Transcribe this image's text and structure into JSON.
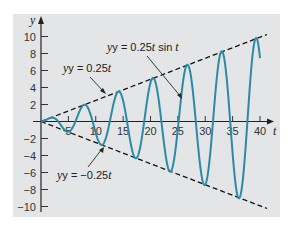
{
  "chart_data": {
    "type": "line",
    "title": "",
    "xlabel": "t",
    "ylabel": "y",
    "xlim": [
      0,
      41
    ],
    "ylim": [
      -11,
      11
    ],
    "x_ticks": [
      5,
      10,
      15,
      20,
      25,
      30,
      35,
      40
    ],
    "y_ticks": [
      -10,
      -8,
      -6,
      -4,
      -2,
      2,
      4,
      6,
      8,
      10
    ],
    "grid": false,
    "legend": "none (inline annotations)",
    "series": [
      {
        "name": "y = 0.25t sin t",
        "style": "solid",
        "color": "#2a8aa8",
        "function": "0.25*t*sin(t)",
        "t_range": [
          0,
          40
        ],
        "sample_points": [
          [
            0,
            0
          ],
          [
            1.57,
            0.39
          ],
          [
            4.71,
            -1.18
          ],
          [
            7.85,
            1.96
          ],
          [
            11.0,
            -2.75
          ],
          [
            14.14,
            3.53
          ],
          [
            17.28,
            -4.32
          ],
          [
            20.42,
            5.1
          ],
          [
            23.56,
            -5.89
          ],
          [
            26.7,
            6.68
          ],
          [
            29.85,
            -7.46
          ],
          [
            32.99,
            8.25
          ],
          [
            36.13,
            -9.03
          ],
          [
            39.27,
            9.82
          ],
          [
            40,
            2.98
          ]
        ]
      },
      {
        "name": "y = 0.25t",
        "style": "dashed",
        "color": "#111111",
        "function": "0.25*t",
        "t_range": [
          0,
          41
        ],
        "sample_points": [
          [
            0,
            0
          ],
          [
            40,
            10
          ]
        ]
      },
      {
        "name": "y = -0.25t",
        "style": "dashed",
        "color": "#111111",
        "function": "-0.25*t",
        "t_range": [
          0,
          41
        ],
        "sample_points": [
          [
            0,
            0
          ],
          [
            40,
            -10
          ]
        ]
      }
    ],
    "annotations": [
      {
        "text": "y = 0.25t sin t",
        "pointing_to": "oscillating curve near t≈26"
      },
      {
        "text": "y = 0.25t",
        "pointing_to": "upper dashed envelope near t≈12"
      },
      {
        "text": "y = −0.25t",
        "pointing_to": "lower dashed envelope near t≈11"
      }
    ]
  },
  "labels": {
    "x_axis": "t",
    "y_axis": "y",
    "annot_curve_prefix": "y = 0.25",
    "annot_curve_t": "t",
    "annot_curve_suffix": " sin ",
    "annot_curve_t2": "t",
    "annot_upper_prefix": "y = 0.25",
    "annot_upper_t": "t",
    "annot_lower_prefix": "y = −0.25",
    "annot_lower_t": "t",
    "y_var": "y"
  },
  "ticks": {
    "x": [
      "5",
      "10",
      "15",
      "20",
      "25",
      "30",
      "35",
      "40"
    ],
    "y_pos": [
      "10",
      "8",
      "6",
      "4",
      "2"
    ],
    "y_neg": [
      "−2",
      "−4",
      "−6",
      "−8",
      "−10"
    ]
  },
  "colors": {
    "curve": "#2a8aa8",
    "panel": "#e4e5e6"
  }
}
